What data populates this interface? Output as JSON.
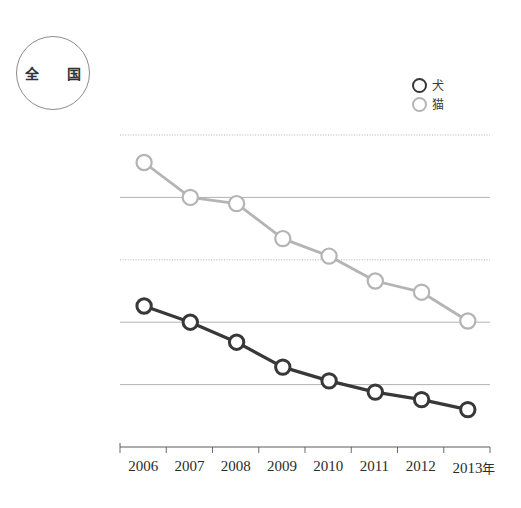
{
  "badge": {
    "label": "全　国"
  },
  "legend": {
    "position": "top-right",
    "entries": [
      {
        "name": "dog",
        "label": "犬",
        "color": "#383838",
        "marker": "open-circle"
      },
      {
        "name": "cat",
        "label": "猫",
        "color": "#b4b4b4",
        "marker": "open-circle"
      }
    ]
  },
  "axis": {
    "y_unit_label": "頭",
    "y_ticks": [
      "250,000",
      "200,000",
      "150,000",
      "100,000",
      "50,000",
      "0"
    ],
    "x_unit_label": "年",
    "x_ticks": [
      "2006",
      "2007",
      "2008",
      "2009",
      "2010",
      "2011",
      "2012",
      "2013"
    ]
  },
  "chart_data": {
    "type": "line",
    "title": "",
    "subtitle": "",
    "xlabel": "年",
    "ylabel": "頭",
    "categories": [
      "2006",
      "2007",
      "2008",
      "2009",
      "2010",
      "2011",
      "2012",
      "2013"
    ],
    "series": [
      {
        "name": "犬",
        "label_en": "dog",
        "color": "#383838",
        "values": [
          113000,
          100000,
          84000,
          64000,
          53000,
          44000,
          38000,
          30000
        ]
      },
      {
        "name": "猫",
        "label_en": "cat",
        "color": "#b4b4b4",
        "values": [
          228000,
          200000,
          195000,
          167000,
          153000,
          133000,
          124000,
          101000
        ]
      }
    ],
    "ylim": [
      0,
      250000
    ],
    "ytick_values": [
      0,
      50000,
      100000,
      150000,
      200000,
      250000
    ],
    "grid": "horizontal",
    "grid_styles": {
      "250000": "dotted",
      "200000": "solid",
      "150000": "dotted",
      "100000": "solid",
      "50000": "solid",
      "0": "axis"
    },
    "legend_position": "top-right"
  }
}
